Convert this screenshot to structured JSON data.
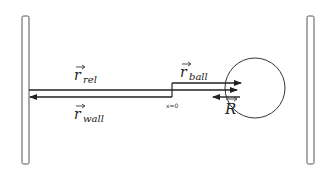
{
  "diagram": {
    "type": "physics-vector-diagram",
    "labels": {
      "r_rel": {
        "base": "r",
        "sub": "rel"
      },
      "r_ball": {
        "base": "r",
        "sub": "ball"
      },
      "r_wall": {
        "base": "r",
        "sub": "wall"
      },
      "R": {
        "base": "R"
      },
      "origin": "x=0"
    },
    "elements": [
      {
        "id": "left-wall",
        "kind": "wall"
      },
      {
        "id": "right-wall",
        "kind": "wall"
      },
      {
        "id": "ball",
        "kind": "circle"
      },
      {
        "id": "r_rel",
        "kind": "vector",
        "direction": "right"
      },
      {
        "id": "r_ball",
        "kind": "vector",
        "direction": "right"
      },
      {
        "id": "r_wall",
        "kind": "vector",
        "direction": "left"
      },
      {
        "id": "R",
        "kind": "vector",
        "direction": "left"
      }
    ],
    "colors": {
      "line": "#222222",
      "wall_fill": "#ffffff",
      "wall_stroke": "#555555"
    }
  }
}
